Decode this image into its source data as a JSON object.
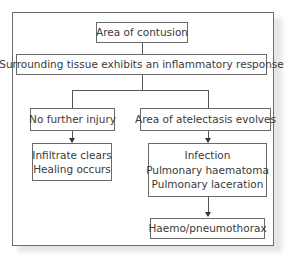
{
  "diagram": {
    "type": "flowchart",
    "nodes": {
      "contusion": {
        "label": "Area of contusion"
      },
      "inflammatory": {
        "label": "Surrounding tissue exhibits an inflammatory response"
      },
      "no_injury": {
        "label": "No further injury"
      },
      "atelectasis": {
        "label": "Area of atelectasis evolves"
      },
      "healing": {
        "lines": [
          "Infiltrate clears",
          "Healing occurs"
        ]
      },
      "complications": {
        "lines": [
          "Infection",
          "Pulmonary haematoma",
          "Pulmonary laceration"
        ]
      },
      "haemo": {
        "label": "Haemo/pneumothorax"
      }
    },
    "edges": [
      {
        "from": "contusion",
        "to": "inflammatory"
      },
      {
        "from": "inflammatory",
        "to": "no_injury"
      },
      {
        "from": "inflammatory",
        "to": "atelectasis"
      },
      {
        "from": "no_injury",
        "to": "healing",
        "arrow": true
      },
      {
        "from": "atelectasis",
        "to": "complications",
        "arrow": true
      },
      {
        "from": "complications",
        "to": "haemo",
        "arrow": true
      }
    ]
  }
}
